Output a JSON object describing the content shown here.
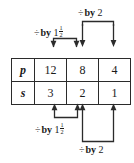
{
  "diagram": {
    "table": {
      "rows": [
        {
          "header": "p",
          "values": [
            "12",
            "8",
            "4"
          ]
        },
        {
          "header": "s",
          "values": [
            "3",
            "2",
            "1"
          ]
        }
      ]
    },
    "annotations": [
      {
        "id": "top-left",
        "position": "above",
        "operator": "÷",
        "word": "by",
        "whole": "1",
        "frac_num": "1",
        "frac_den": "2",
        "text": "÷ by 1 1/2",
        "from_column": 1,
        "to_column": 2
      },
      {
        "id": "top-right",
        "position": "above",
        "operator": "÷",
        "word": "by",
        "whole": "2",
        "frac_num": "",
        "frac_den": "",
        "text": "÷ by 2",
        "from_column": 2,
        "to_column": 3
      },
      {
        "id": "bottom-left",
        "position": "below",
        "operator": "÷",
        "word": "by",
        "whole": "1",
        "frac_num": "1",
        "frac_den": "2",
        "text": "÷ by 1 1/2",
        "from_column": 1,
        "to_column": 2
      },
      {
        "id": "bottom-right",
        "position": "below",
        "operator": "÷",
        "word": "by",
        "whole": "2",
        "frac_num": "",
        "frac_den": "",
        "text": "÷ by 2",
        "from_column": 2,
        "to_column": 3
      }
    ],
    "colors": {
      "ink": "#1a1a1a",
      "rule": "#2b2b2b",
      "background": "#ffffff"
    }
  }
}
